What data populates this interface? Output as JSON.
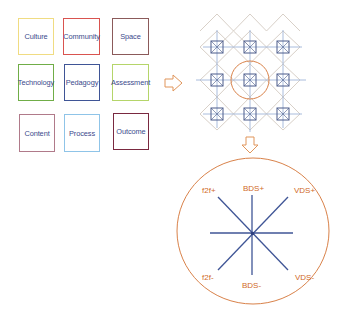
{
  "categories_grid": {
    "boxes": [
      {
        "label": "Culture",
        "color": "#f0dc82",
        "x": 18,
        "y": 18,
        "w": 36,
        "h": 37
      },
      {
        "label": "Community",
        "color": "#d9534f",
        "x": 63,
        "y": 18,
        "w": 37,
        "h": 37
      },
      {
        "label": "Space",
        "color": "#8b5a5a",
        "x": 112,
        "y": 18,
        "w": 37,
        "h": 37
      },
      {
        "label": "Technology",
        "color": "#70ad47",
        "x": 18,
        "y": 64,
        "w": 36,
        "h": 37
      },
      {
        "label": "Pedagogy",
        "color": "#3f5596",
        "x": 64,
        "y": 64,
        "w": 36,
        "h": 37
      },
      {
        "label": "Assessment",
        "color": "#b5d56a",
        "x": 112,
        "y": 64,
        "w": 37,
        "h": 37
      },
      {
        "label": "Content",
        "color": "#b07a8a",
        "x": 19,
        "y": 114,
        "w": 36,
        "h": 38
      },
      {
        "label": "Process",
        "color": "#8fc4e8",
        "x": 64,
        "y": 114,
        "w": 36,
        "h": 38
      },
      {
        "label": "Outcome",
        "color": "#7a2940",
        "x": 113,
        "y": 113,
        "w": 36,
        "h": 37
      }
    ],
    "text_color": "#3b4a8c"
  },
  "arrows": {
    "right_arrow": {
      "direction": "right",
      "color": "#e0955a"
    },
    "down_arrow": {
      "direction": "down",
      "color": "#e0955a"
    }
  },
  "lattice": {
    "node_centers_x": [
      217,
      250,
      283
    ],
    "node_centers_y": [
      47,
      80,
      114
    ],
    "node_color": "#4a5a8a",
    "line_color": "#9fb4d8",
    "diamond_color": "#d8d0c8",
    "highlight_circle": {
      "cx": 250,
      "cy": 80,
      "r": 19,
      "color": "#d9824a"
    }
  },
  "axes_diagram": {
    "circle": {
      "cx": 253,
      "cy": 231,
      "rx": 76,
      "ry": 73,
      "color": "#d9824a"
    },
    "center": {
      "x": 252,
      "y": 233
    },
    "line_color": "#3f5596",
    "labels": {
      "f2f_plus": "f2f+",
      "bds_plus": "BDS+",
      "vds_plus": "VDS+",
      "f2f_minus": "f2f-",
      "bds_minus": "BDS-",
      "vds_minus": "VDS-"
    },
    "label_color": "#d06a28"
  }
}
